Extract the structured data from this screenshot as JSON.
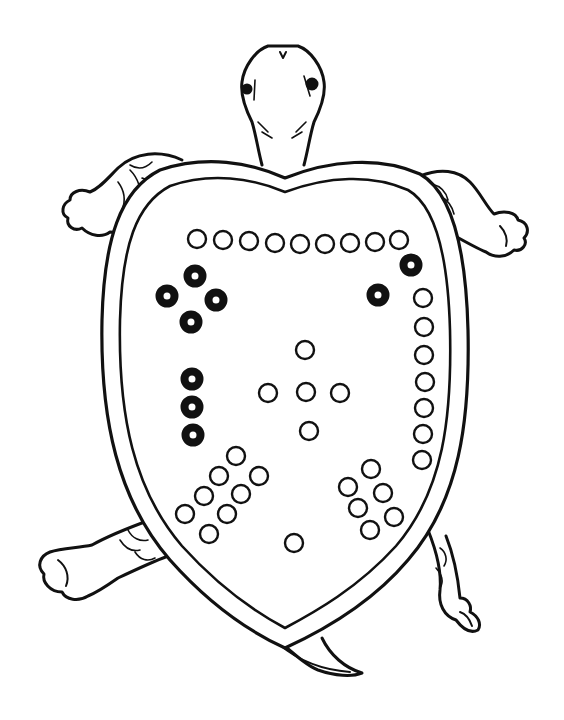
{
  "image": {
    "subject": "Lo Shu magic square depicted on a turtle shell",
    "ink_color": "#111111",
    "background": "#ffffff"
  },
  "lo_shu": {
    "magic_sum": 15,
    "groups": [
      {
        "position": "top",
        "count": 9,
        "style": "open",
        "layout": "row",
        "dots": [
          [
            197,
            239
          ],
          [
            223,
            240
          ],
          [
            249,
            241
          ],
          [
            275,
            243
          ],
          [
            300,
            244
          ],
          [
            325,
            244
          ],
          [
            350,
            243
          ],
          [
            375,
            242
          ],
          [
            399,
            240
          ]
        ]
      },
      {
        "position": "top-right",
        "count": 2,
        "style": "filled",
        "layout": "pair",
        "dots": [
          [
            411,
            265
          ],
          [
            378,
            295
          ]
        ]
      },
      {
        "position": "right",
        "count": 7,
        "style": "open",
        "layout": "column",
        "dots": [
          [
            423,
            298
          ],
          [
            424,
            327
          ],
          [
            424,
            355
          ],
          [
            425,
            382
          ],
          [
            424,
            408
          ],
          [
            423,
            434
          ],
          [
            422,
            460
          ]
        ]
      },
      {
        "position": "top-left",
        "count": 4,
        "style": "filled",
        "layout": "diamond",
        "dots": [
          [
            195,
            276
          ],
          [
            167,
            296
          ],
          [
            216,
            300
          ],
          [
            191,
            322
          ]
        ]
      },
      {
        "position": "left",
        "count": 3,
        "style": "filled",
        "layout": "column",
        "dots": [
          [
            192,
            379
          ],
          [
            192,
            407
          ],
          [
            193,
            435
          ]
        ]
      },
      {
        "position": "center",
        "count": 5,
        "style": "open",
        "layout": "cross",
        "dots": [
          [
            305,
            350
          ],
          [
            268,
            393
          ],
          [
            306,
            392
          ],
          [
            340,
            393
          ],
          [
            309,
            431
          ]
        ]
      },
      {
        "position": "bottom-left",
        "count": 8,
        "style": "open",
        "layout": "diagonal-double-row",
        "dots": [
          [
            236,
            456
          ],
          [
            219,
            476
          ],
          [
            204,
            496
          ],
          [
            185,
            514
          ],
          [
            259,
            476
          ],
          [
            241,
            494
          ],
          [
            227,
            514
          ],
          [
            209,
            534
          ]
        ]
      },
      {
        "position": "bottom-right",
        "count": 6,
        "style": "open",
        "layout": "diagonal-double-row",
        "dots": [
          [
            371,
            469
          ],
          [
            348,
            487
          ],
          [
            358,
            508
          ],
          [
            383,
            493
          ],
          [
            394,
            517
          ],
          [
            370,
            530
          ]
        ]
      },
      {
        "position": "bottom",
        "count": 1,
        "style": "open",
        "layout": "single",
        "dots": [
          [
            294,
            543
          ]
        ]
      }
    ]
  }
}
